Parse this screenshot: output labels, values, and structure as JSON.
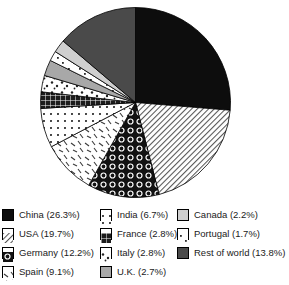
{
  "chart_data": {
    "type": "pie",
    "title": "",
    "subtitle": "",
    "xlabel": "",
    "ylabel": "",
    "legend_position": "bottom",
    "grid": false,
    "start_angle_deg": 0,
    "direction": "clockwise",
    "categories": [
      "China",
      "USA",
      "Germany",
      "Spain",
      "India",
      "France",
      "Italy",
      "U.K.",
      "Portugal",
      "Canada",
      "Rest of world"
    ],
    "values": [
      26.3,
      19.7,
      12.2,
      9.1,
      6.7,
      2.8,
      2.8,
      2.7,
      1.7,
      2.2,
      13.8
    ],
    "unit": "%",
    "slices": [
      {
        "label": "China",
        "value": 26.3,
        "legend_text": "China (26.3%)",
        "pattern": "solid-black",
        "fill": "#0d0d0d"
      },
      {
        "label": "USA",
        "value": 19.7,
        "legend_text": "USA (19.7%)",
        "pattern": "diagonal-hatch",
        "fill": "#d9d9d9"
      },
      {
        "label": "Germany",
        "value": 12.2,
        "legend_text": "Germany (12.2%)",
        "pattern": "dark-circles",
        "fill": "#141414"
      },
      {
        "label": "Spain",
        "value": 9.1,
        "legend_text": "Spain (9.1%)",
        "pattern": "light-dashes",
        "fill": "#fbfbfb"
      },
      {
        "label": "India",
        "value": 6.7,
        "legend_text": "India (6.7%)",
        "pattern": "fine-dots",
        "fill": "#fdfdfd"
      },
      {
        "label": "France",
        "value": 2.8,
        "legend_text": "France (2.8%)",
        "pattern": "dark-grid",
        "fill": "#1f1f1f"
      },
      {
        "label": "Italy",
        "value": 2.8,
        "legend_text": "Italy (2.8%)",
        "pattern": "scatter-dots",
        "fill": "#fafafa"
      },
      {
        "label": "U.K.",
        "value": 2.7,
        "legend_text": "U.K. (2.7%)",
        "pattern": "medium-gray",
        "fill": "#a8a8a8"
      },
      {
        "label": "Portugal",
        "value": 1.7,
        "legend_text": "Portugal (1.7%)",
        "pattern": "sparse-marks",
        "fill": "#ffffff"
      },
      {
        "label": "Canada",
        "value": 2.2,
        "legend_text": "Canada (2.2%)",
        "pattern": "light-gray",
        "fill": "#cfcfcf"
      },
      {
        "label": "Rest of world",
        "value": 13.8,
        "legend_text": "Rest of world (13.8%)",
        "pattern": "dark-gray",
        "fill": "#4a4a4a"
      }
    ]
  },
  "legend": {
    "columns": [
      [
        "China (26.3%)",
        "USA (19.7%)",
        "Germany (12.2%)",
        "Spain (9.1%)"
      ],
      [
        "India (6.7%)",
        "France (2.8%)",
        "Italy (2.8%)",
        "U.K. (2.7%)"
      ],
      [
        "Canada (2.2%)",
        "Portugal (1.7%)",
        "Rest of world (13.8%)"
      ]
    ]
  }
}
